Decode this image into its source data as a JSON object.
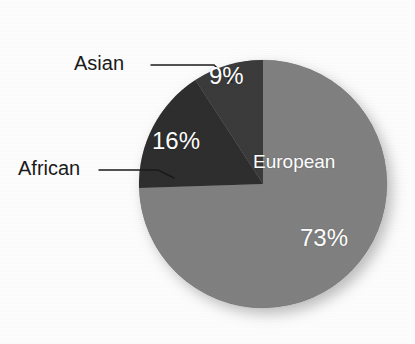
{
  "chart_data": {
    "type": "pie",
    "title": "",
    "subtitle": "",
    "xlabel": "",
    "ylabel": "",
    "grid": false,
    "legend_position": "none",
    "start_angle_deg": 0,
    "direction": "clockwise",
    "categories": [
      "European",
      "African",
      "Asian"
    ],
    "values": [
      73,
      16,
      9
    ],
    "value_labels": [
      "73%",
      "16%",
      "9%"
    ],
    "colors": [
      "#808080",
      "#2e2e2e",
      "#3a3a3a"
    ],
    "slices": [
      {
        "name": "European",
        "label": "European",
        "value": 73,
        "value_label": "73%",
        "color": "#808080",
        "label_placement": "inside",
        "label_color": "#ffffff"
      },
      {
        "name": "African",
        "label": "African",
        "value": 16,
        "value_label": "16%",
        "color": "#2e2e2e",
        "label_placement": "outside-leader",
        "label_color": "#1a1a1a"
      },
      {
        "name": "Asian",
        "label": "Asian",
        "value": 9,
        "value_label": "9%",
        "color": "#3a3a3a",
        "label_placement": "outside-leader",
        "label_color": "#1a1a1a"
      }
    ]
  },
  "figure": {
    "background_color": "#fdfdfd",
    "pie": {
      "center_x": 263,
      "center_y": 184,
      "radius": 124,
      "shadow": true
    },
    "labels": {
      "asian_text": "Asian",
      "african_text": "African",
      "european_text": "European",
      "pct_european": "73%",
      "pct_african": "16%",
      "pct_asian": "9%"
    },
    "leader_lines": {
      "asian_color": "#1a1a1a",
      "african_color": "#1a1a1a"
    }
  }
}
